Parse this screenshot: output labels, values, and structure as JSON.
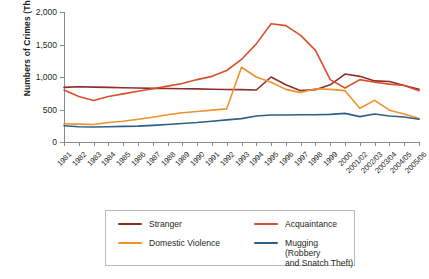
{
  "chart_data": {
    "type": "line",
    "title": "",
    "xlabel": "",
    "ylabel": "Numbers of Crimes (Thousands)",
    "ylim": [
      0,
      2000
    ],
    "yticks": [
      0,
      500,
      1000,
      1500,
      2000
    ],
    "ytick_labels": [
      "0",
      "500",
      "1,000",
      "1,500",
      "2,000"
    ],
    "grid": false,
    "legend_position": "bottom",
    "categories": [
      "1981",
      "1982",
      "1983",
      "1984",
      "1985",
      "1986",
      "1987",
      "1988",
      "1989",
      "1990",
      "1991",
      "1992",
      "1993",
      "1994",
      "1995",
      "1996",
      "1997",
      "1998",
      "1999",
      "2000",
      "2001/02",
      "2002/03",
      "2003/04",
      "2004/05",
      "2005/06"
    ],
    "series": [
      {
        "name": "Stranger",
        "color": "#8c2f2a",
        "values": [
          840,
          850,
          845,
          840,
          835,
          830,
          825,
          822,
          820,
          818,
          812,
          808,
          805,
          800,
          1000,
          880,
          790,
          805,
          880,
          1045,
          1010,
          940,
          930,
          870,
          810
        ]
      },
      {
        "name": "Acquaintance",
        "color": "#d94f2b",
        "values": [
          800,
          700,
          640,
          700,
          740,
          780,
          820,
          860,
          900,
          960,
          1010,
          1100,
          1270,
          1510,
          1820,
          1790,
          1640,
          1410,
          960,
          830,
          960,
          920,
          890,
          870,
          790
        ]
      },
      {
        "name": "Domestic Violence",
        "color": "#f0912d",
        "values": [
          280,
          275,
          270,
          300,
          320,
          350,
          380,
          420,
          450,
          470,
          490,
          510,
          1150,
          1000,
          920,
          810,
          760,
          820,
          810,
          790,
          520,
          640,
          490,
          430,
          360
        ]
      },
      {
        "name": "Mugging (Robbery\nand Snatch Theft)",
        "color": "#2e5f86",
        "values": [
          250,
          235,
          230,
          235,
          240,
          245,
          255,
          270,
          285,
          300,
          320,
          340,
          360,
          400,
          415,
          415,
          420,
          420,
          425,
          440,
          390,
          430,
          400,
          385,
          350
        ]
      }
    ]
  },
  "legend": {
    "items": [
      {
        "label": "Stranger",
        "color": "#8c2f2a"
      },
      {
        "label": "Domestic Violence",
        "color": "#f0912d"
      },
      {
        "label": "Acquaintance",
        "color": "#d94f2b"
      },
      {
        "label": "Mugging (Robbery\nand Snatch Theft)",
        "color": "#2e5f86"
      }
    ]
  }
}
